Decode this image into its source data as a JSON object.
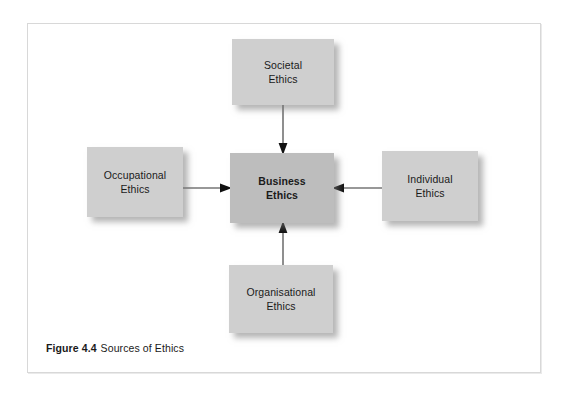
{
  "figure": {
    "caption_number": "Figure 4.4",
    "caption_text": "Sources of Ethics",
    "frame_color": "#d8d8d8",
    "background": "#ffffff"
  },
  "diagram": {
    "type": "hub-and-spoke",
    "center": {
      "id": "business-ethics",
      "label": "Business\nEthics",
      "emphasis": "bold",
      "fill": "#bdbdbd"
    },
    "sources": [
      {
        "id": "societal-ethics",
        "label": "Societal\nEthics",
        "position": "top",
        "fill": "#cfcfcf"
      },
      {
        "id": "occupational-ethics",
        "label": "Occupational\nEthics",
        "position": "left",
        "fill": "#cfcfcf"
      },
      {
        "id": "individual-ethics",
        "label": "Individual\nEthics",
        "position": "right",
        "fill": "#cfcfcf"
      },
      {
        "id": "organisational-ethics",
        "label": "Organisational\nEthics",
        "position": "bottom",
        "fill": "#cfcfcf"
      }
    ],
    "connectors": [
      {
        "id": "societal-to-business",
        "from": "societal-ethics",
        "to": "business-ethics",
        "direction": "down",
        "arrowhead": "solid-triangle",
        "color": "#333333"
      },
      {
        "id": "occupational-to-business",
        "from": "occupational-ethics",
        "to": "business-ethics",
        "direction": "right",
        "arrowhead": "solid-triangle",
        "color": "#333333"
      },
      {
        "id": "individual-to-business",
        "from": "individual-ethics",
        "to": "business-ethics",
        "direction": "left",
        "arrowhead": "solid-triangle",
        "color": "#333333"
      },
      {
        "id": "organisational-to-business",
        "from": "organisational-ethics",
        "to": "business-ethics",
        "direction": "up",
        "arrowhead": "solid-triangle",
        "color": "#333333"
      }
    ]
  }
}
